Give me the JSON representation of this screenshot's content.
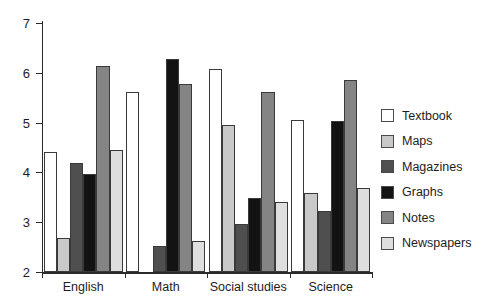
{
  "chart_data": {
    "type": "bar",
    "title": "",
    "subtitle": "",
    "xlabel": "",
    "ylabel": "",
    "grid": false,
    "legend_position": "right",
    "categories": [
      "English",
      "Math",
      "Social studies",
      "Science"
    ],
    "ylim": [
      2,
      7
    ],
    "ytick_labels": [
      "2",
      "3",
      "4",
      "5",
      "6",
      "7"
    ],
    "ytick_values": [
      2,
      3,
      4,
      5,
      6,
      7
    ],
    "series": [
      {
        "name": "Textbook",
        "color": "#ffffff",
        "values": [
          4.4,
          5.62,
          6.08,
          5.05
        ]
      },
      {
        "name": "Maps",
        "color": "#c9c9c9",
        "values": [
          2.68,
          2.0,
          4.95,
          3.59
        ]
      },
      {
        "name": "Magazines",
        "color": "#4f4f4f",
        "values": [
          4.18,
          2.52,
          2.96,
          3.22
        ]
      },
      {
        "name": "Graphs",
        "color": "#131313",
        "values": [
          3.97,
          6.28,
          3.49,
          5.04
        ]
      },
      {
        "name": "Notes",
        "color": "#848484",
        "values": [
          6.14,
          5.77,
          5.61,
          5.85
        ]
      },
      {
        "name": "Newspapers",
        "color": "#dedede",
        "values": [
          4.45,
          2.62,
          3.41,
          3.69
        ]
      }
    ]
  }
}
